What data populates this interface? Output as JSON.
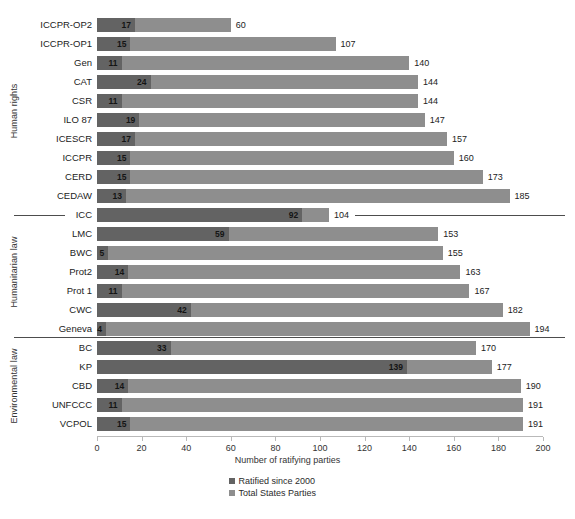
{
  "chart_data": {
    "type": "bar",
    "orientation": "horizontal",
    "stacked": false,
    "title": "",
    "subtitle": "",
    "xlabel": "Number of ratifying parties",
    "ylabel": "",
    "xlim": [
      0,
      200
    ],
    "xticks": [
      0,
      20,
      40,
      60,
      80,
      100,
      120,
      140,
      160,
      180,
      200
    ],
    "grid": false,
    "legend_position": "bottom-center",
    "legend": [
      "Ratified since 2000",
      "Total States Parties"
    ],
    "colors": {
      "ratified_since_2000": "#636363",
      "total_states_parties": "#8e8e8e",
      "axis": "#b9b9b9",
      "separator": "#4d4d4d",
      "text": "#2b2b2b"
    },
    "series": [
      {
        "name": "Ratified since 2000",
        "values": [
          17,
          15,
          11,
          24,
          11,
          19,
          17,
          15,
          15,
          13,
          92,
          59,
          5,
          14,
          11,
          42,
          4,
          33,
          139,
          14,
          11,
          15
        ]
      },
      {
        "name": "Total States Parties",
        "values": [
          60,
          107,
          140,
          144,
          144,
          147,
          157,
          160,
          173,
          185,
          104,
          153,
          155,
          163,
          167,
          182,
          194,
          170,
          177,
          190,
          191,
          191
        ]
      }
    ],
    "categories": [
      "ICCPR-OP2",
      "ICCPR-OP1",
      "Gen",
      "CAT",
      "CSR",
      "ILO 87",
      "ICESCR",
      "ICCPR",
      "CERD",
      "CEDAW",
      "ICC",
      "LMC",
      "BWC",
      "Prot2",
      "Prot 1",
      "CWC",
      "Geneva",
      "BC",
      "KP",
      "CBD",
      "UNFCCC",
      "VCPOL"
    ],
    "groups": [
      {
        "label": "Human rights",
        "start_index": 0,
        "end_index": 9
      },
      {
        "label": "Humanitarian law",
        "start_index": 10,
        "end_index": 16
      },
      {
        "label": "Environmental law",
        "start_index": 17,
        "end_index": 21
      }
    ],
    "rows": [
      {
        "category": "ICCPR-OP2",
        "ratified_since_2000": 17,
        "total": 60,
        "group": "Human rights"
      },
      {
        "category": "ICCPR-OP1",
        "ratified_since_2000": 15,
        "total": 107,
        "group": "Human rights"
      },
      {
        "category": "Gen",
        "ratified_since_2000": 11,
        "total": 140,
        "group": "Human rights"
      },
      {
        "category": "CAT",
        "ratified_since_2000": 24,
        "total": 144,
        "group": "Human rights"
      },
      {
        "category": "CSR",
        "ratified_since_2000": 11,
        "total": 144,
        "group": "Human rights"
      },
      {
        "category": "ILO 87",
        "ratified_since_2000": 19,
        "total": 147,
        "group": "Human rights"
      },
      {
        "category": "ICESCR",
        "ratified_since_2000": 17,
        "total": 157,
        "group": "Human rights"
      },
      {
        "category": "ICCPR",
        "ratified_since_2000": 15,
        "total": 160,
        "group": "Human rights"
      },
      {
        "category": "CERD",
        "ratified_since_2000": 15,
        "total": 173,
        "group": "Human rights"
      },
      {
        "category": "CEDAW",
        "ratified_since_2000": 13,
        "total": 185,
        "group": "Human rights"
      },
      {
        "category": "ICC",
        "ratified_since_2000": 92,
        "total": 104,
        "group": "Humanitarian law"
      },
      {
        "category": "LMC",
        "ratified_since_2000": 59,
        "total": 153,
        "group": "Humanitarian law"
      },
      {
        "category": "BWC",
        "ratified_since_2000": 5,
        "total": 155,
        "group": "Humanitarian law"
      },
      {
        "category": "Prot2",
        "ratified_since_2000": 14,
        "total": 163,
        "group": "Humanitarian law"
      },
      {
        "category": "Prot 1",
        "ratified_since_2000": 11,
        "total": 167,
        "group": "Humanitarian law"
      },
      {
        "category": "CWC",
        "ratified_since_2000": 42,
        "total": 182,
        "group": "Humanitarian law"
      },
      {
        "category": "Geneva",
        "ratified_since_2000": 4,
        "total": 194,
        "group": "Humanitarian law"
      },
      {
        "category": "BC",
        "ratified_since_2000": 33,
        "total": 170,
        "group": "Environmental law"
      },
      {
        "category": "KP",
        "ratified_since_2000": 139,
        "total": 177,
        "group": "Environmental law"
      },
      {
        "category": "CBD",
        "ratified_since_2000": 14,
        "total": 190,
        "group": "Environmental law"
      },
      {
        "category": "UNFCCC",
        "ratified_since_2000": 11,
        "total": 191,
        "group": "Environmental law"
      },
      {
        "category": "VCPOL",
        "ratified_since_2000": 15,
        "total": 191,
        "group": "Environmental law"
      }
    ]
  }
}
